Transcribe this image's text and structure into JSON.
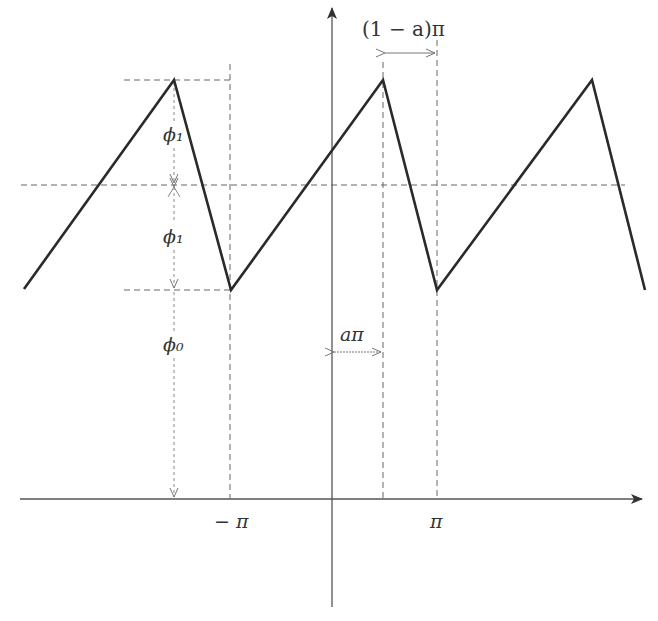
{
  "diagram": {
    "type": "sawtooth-waveform",
    "labels": {
      "period_width": "(1 − a)π",
      "phi1_upper": "ϕ₁",
      "phi1_lower": "ϕ₁",
      "phi0": "ϕ₀",
      "a_pi": "aπ",
      "neg_pi": "− π",
      "pi": "π"
    },
    "colors": {
      "waveform": "#2a2a2a",
      "axes": "#555555",
      "dashed": "#666666",
      "labels": "#333333"
    }
  }
}
